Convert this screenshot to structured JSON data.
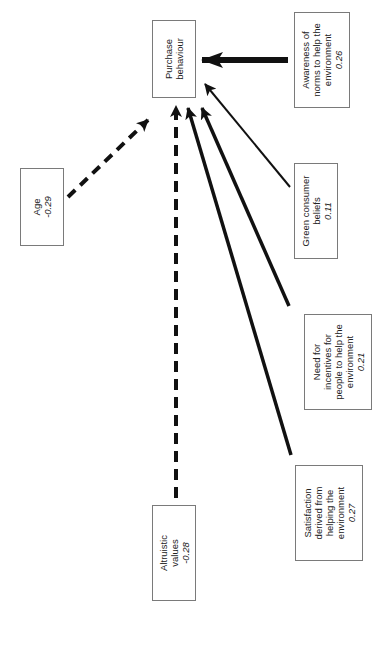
{
  "diagram": {
    "type": "path-diagram",
    "orientation": "rotated-90-ccw",
    "target": {
      "id": "purchase",
      "lines": [
        "Purchase",
        "behaviour"
      ]
    },
    "predictors": [
      {
        "id": "awareness",
        "lines": [
          "Awareness of",
          "norms to help the",
          "environment"
        ],
        "coefficient": "0.26",
        "line_style": "solid-thick"
      },
      {
        "id": "green",
        "lines": [
          "Green consumer",
          "beliefs"
        ],
        "coefficient": "0.11",
        "line_style": "solid-thin"
      },
      {
        "id": "incentives",
        "lines": [
          "Need for",
          "incentives for",
          "people to help the",
          "environment"
        ],
        "coefficient": "0.21",
        "line_style": "solid"
      },
      {
        "id": "satisfaction",
        "lines": [
          "Satisfaction",
          "derived from",
          "helping the",
          "environment"
        ],
        "coefficient": "0.27",
        "line_style": "solid-thick"
      },
      {
        "id": "altruistic",
        "lines": [
          "Altruistic",
          "values"
        ],
        "coefficient": "-0.28",
        "line_style": "dashed"
      },
      {
        "id": "age",
        "lines": [
          "Age"
        ],
        "coefficient": "-0.29",
        "line_style": "dashed"
      }
    ],
    "colors": {
      "line": "#111111",
      "border": "#7a7a7a",
      "text": "#222222"
    }
  }
}
